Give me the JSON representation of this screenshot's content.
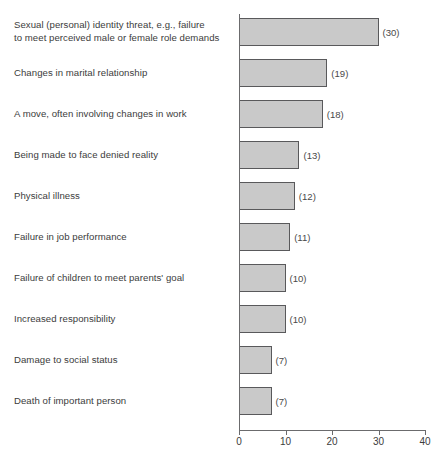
{
  "chart_data": {
    "type": "bar",
    "orientation": "horizontal",
    "title": "",
    "subtitle": "",
    "xlabel": "",
    "ylabel": "",
    "xlim": [
      0,
      40
    ],
    "xticks": [
      0,
      10,
      20,
      30,
      40
    ],
    "xtick_labels": [
      "0",
      "10",
      "20",
      "30",
      "40"
    ],
    "grid": false,
    "legend": null,
    "value_label_format": "(value)",
    "bar_fill_color": "#c9c9c9",
    "bar_border_color": "#59595b",
    "axis_color": "#6b6b6d",
    "text_color": "#3c3c3c",
    "categories": [
      "Sexual (personal) identity threat, e.g., failure\nto meet perceived male or female role demands",
      "Changes in marital relationship",
      "A move, often involving changes in work",
      "Being made to face denied reality",
      "Physical illness",
      "Failure in job performance",
      "Failure of children to meet parents' goal",
      "Increased responsibility",
      "Damage to social status",
      "Death of important person"
    ],
    "values": [
      30,
      19,
      18,
      13,
      12,
      11,
      10,
      10,
      7,
      7
    ],
    "value_labels": [
      "(30)",
      "(19)",
      "(18)",
      "(13)",
      "(12)",
      "(11)",
      "(10)",
      "(10)",
      "(7)",
      "(7)"
    ]
  }
}
